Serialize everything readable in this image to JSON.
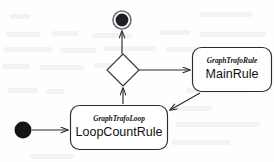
{
  "diagram": {
    "kind": "uml-activity-diagram",
    "title": "",
    "background_color": "#fefefe",
    "stroke_color": "#2b2b2b",
    "fill_color": "#ffffff",
    "text_color": "#101010",
    "nodes": [
      {
        "id": "initial",
        "type": "initial-node",
        "label": "",
        "cx": 23,
        "cy": 130,
        "r": 8.5
      },
      {
        "id": "loopcountrule",
        "type": "state",
        "stereotype": "GraphTrafoLoop",
        "name": "LoopCountRule",
        "x": 70,
        "y": 105,
        "width": 98,
        "height": 45
      },
      {
        "id": "decision",
        "type": "decision-diamond",
        "label": "",
        "cx": 123,
        "cy": 70,
        "half_width": 16,
        "half_height": 16
      },
      {
        "id": "mainrule",
        "type": "state",
        "stereotype": "GraphTrafoRule",
        "name": "MainRule",
        "x": 192,
        "y": 47,
        "width": 80,
        "height": 45
      },
      {
        "id": "final",
        "type": "final-node",
        "label": "",
        "cx": 122,
        "cy": 20,
        "outer_r": 9,
        "inner_r": 6.5
      }
    ],
    "edges": [
      {
        "id": "edge-initial-to-loop",
        "from": "initial",
        "to": "loopcountrule",
        "label": "",
        "arrowhead": "open"
      },
      {
        "id": "edge-loop-to-decision",
        "from": "loopcountrule",
        "to": "decision",
        "label": "",
        "arrowhead": "open"
      },
      {
        "id": "edge-decision-to-mainrule",
        "from": "decision",
        "to": "mainrule",
        "label": "",
        "arrowhead": "open"
      },
      {
        "id": "edge-mainrule-to-loop",
        "from": "mainrule",
        "to": "loopcountrule",
        "label": "",
        "arrowhead": "open"
      },
      {
        "id": "edge-decision-to-final",
        "from": "decision",
        "to": "final",
        "label": "",
        "arrowhead": "open"
      }
    ]
  }
}
